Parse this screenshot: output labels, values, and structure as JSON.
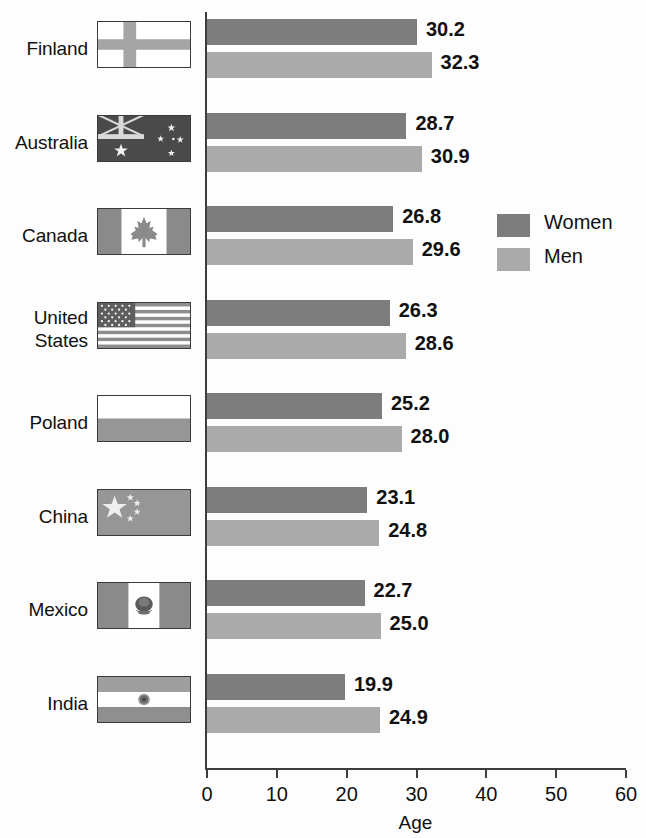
{
  "chart_data": {
    "type": "bar",
    "orientation": "horizontal",
    "title": "",
    "xlabel": "Age",
    "ylabel": "",
    "xlim": [
      0,
      60
    ],
    "xticks": [
      0,
      10,
      20,
      30,
      40,
      50,
      60
    ],
    "xtick_labels": [
      "0",
      "10",
      "20",
      "30",
      "40",
      "50",
      "60"
    ],
    "grid": false,
    "legend_position": "inside-right",
    "categories": [
      "Finland",
      "Australia",
      "Canada",
      "United States",
      "Poland",
      "China",
      "Mexico",
      "India"
    ],
    "series": [
      {
        "name": "Women",
        "color": "#7d7d7d",
        "values": [
          30.2,
          28.7,
          26.8,
          26.3,
          25.2,
          23.1,
          22.7,
          19.9
        ],
        "labels": [
          "30.2",
          "28.7",
          "26.8",
          "26.3",
          "25.2",
          "23.1",
          "22.7",
          "19.9"
        ]
      },
      {
        "name": "Men",
        "color": "#aaaaaa",
        "values": [
          32.3,
          30.9,
          29.6,
          28.6,
          28.0,
          24.8,
          25.0,
          24.9
        ],
        "labels": [
          "32.3",
          "30.9",
          "29.6",
          "28.6",
          "28.0",
          "24.8",
          "25.0",
          "24.9"
        ]
      }
    ]
  },
  "rows": [
    {
      "label": "Finland",
      "label_line1": "Finland",
      "label_line2": "",
      "flag": "finland-flag",
      "women": "30.2",
      "men": "32.3"
    },
    {
      "label": "Australia",
      "label_line1": "Australia",
      "label_line2": "",
      "flag": "australia-flag",
      "women": "28.7",
      "men": "30.9"
    },
    {
      "label": "Canada",
      "label_line1": "Canada",
      "label_line2": "",
      "flag": "canada-flag",
      "women": "26.8",
      "men": "29.6"
    },
    {
      "label": "United States",
      "label_line1": "United",
      "label_line2": "States",
      "flag": "united-states-flag",
      "women": "26.3",
      "men": "28.6"
    },
    {
      "label": "Poland",
      "label_line1": "Poland",
      "label_line2": "",
      "flag": "poland-flag",
      "women": "25.2",
      "men": "28.0"
    },
    {
      "label": "China",
      "label_line1": "China",
      "label_line2": "",
      "flag": "china-flag",
      "women": "23.1",
      "men": "24.8"
    },
    {
      "label": "Mexico",
      "label_line1": "Mexico",
      "label_line2": "",
      "flag": "mexico-flag",
      "women": "22.7",
      "men": "25.0"
    },
    {
      "label": "India",
      "label_line1": "India",
      "label_line2": "",
      "flag": "india-flag",
      "women": "19.9",
      "men": "24.9"
    }
  ],
  "legend": {
    "items": [
      {
        "label": "Women",
        "color": "#7d7d7d"
      },
      {
        "label": "Men",
        "color": "#aaaaaa"
      }
    ]
  },
  "axis": {
    "x_title": "Age",
    "ticks": [
      "0",
      "10",
      "20",
      "30",
      "40",
      "50",
      "60"
    ]
  },
  "colors": {
    "women": "#7d7d7d",
    "men": "#aaaaaa",
    "axis": "#3d3d3d",
    "text": "#111111",
    "background": "#fdfdfd"
  }
}
